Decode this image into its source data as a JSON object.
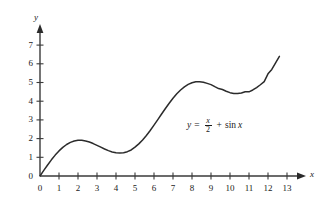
{
  "chart_data": {
    "type": "line",
    "title": "",
    "subtitle": "",
    "xlabel": "x",
    "ylabel": "y",
    "xlim": [
      0,
      13.6
    ],
    "ylim": [
      0,
      7.6
    ],
    "grid": false,
    "legend": null,
    "x_ticks": [
      0,
      1,
      2,
      3,
      4,
      5,
      6,
      7,
      8,
      9,
      10,
      11,
      12,
      13
    ],
    "x_tick_labels": [
      "0",
      "1",
      "2",
      "3",
      "4",
      "5",
      "6",
      "7",
      "8",
      "9",
      "10",
      "11",
      "12",
      "13"
    ],
    "y_ticks": [
      0,
      1,
      2,
      3,
      4,
      5,
      6,
      7
    ],
    "y_tick_labels": [
      "0",
      "1",
      "2",
      "3",
      "4",
      "5",
      "6",
      "7"
    ],
    "curve_color": "#2b2b2b",
    "axis_color": "#3a3a3a",
    "series": [
      {
        "name": "y = x/2 + sin x",
        "x_start": 0,
        "x_end": 12.6,
        "points": [
          [
            0.0,
            0.0
          ],
          [
            0.2,
            0.2987
          ],
          [
            0.4,
            0.5894
          ],
          [
            0.6,
            0.8646
          ],
          [
            0.8,
            1.1174
          ],
          [
            1.0,
            1.3415
          ],
          [
            1.2,
            1.532
          ],
          [
            1.4,
            1.6854
          ],
          [
            1.6,
            1.7996
          ],
          [
            1.8,
            1.8738
          ],
          [
            2.0,
            1.9093
          ],
          [
            2.2,
            1.9085
          ],
          [
            2.4,
            1.8755
          ],
          [
            2.6,
            1.8157
          ],
          [
            2.8,
            1.735
          ],
          [
            3.0,
            1.6411
          ],
          [
            3.2,
            1.5416
          ],
          [
            3.4,
            1.4443
          ],
          [
            3.6,
            1.3572
          ],
          [
            3.8,
            1.2876
          ],
          [
            4.0,
            1.2432
          ],
          [
            4.2,
            1.2286
          ],
          [
            4.4,
            1.2472
          ],
          [
            4.6,
            1.3016
          ],
          [
            4.8,
            1.3924
          ],
          [
            5.0,
            1.5411
          ],
          [
            5.2,
            1.7169
          ],
          [
            5.4,
            1.9274
          ],
          [
            5.6,
            2.1686
          ],
          [
            5.8,
            2.436
          ],
          [
            6.0,
            2.7206
          ],
          [
            6.2,
            3.0172
          ],
          [
            6.4,
            3.3165
          ],
          [
            6.6,
            3.611
          ],
          [
            6.8,
            3.8925
          ],
          [
            7.0,
            4.157
          ],
          [
            7.2,
            4.3934
          ],
          [
            7.4,
            4.5987
          ],
          [
            7.6,
            4.7684
          ],
          [
            7.8,
            4.8989
          ],
          [
            8.0,
            4.9894
          ],
          [
            8.2,
            5.0381
          ],
          [
            8.4,
            5.0461
          ],
          [
            8.6,
            5.0164
          ],
          [
            8.8,
            4.9531
          ],
          [
            9.0,
            4.8879
          ],
          [
            9.2,
            4.7788
          ],
          [
            9.4,
            4.6762
          ],
          [
            9.6,
            4.6253
          ],
          [
            9.8,
            4.5342
          ],
          [
            10.0,
            4.456
          ],
          [
            10.2,
            4.4129
          ],
          [
            10.4,
            4.4066
          ],
          [
            10.6,
            4.4373
          ],
          [
            10.8,
            4.5036
          ],
          [
            11.0,
            4.5
          ],
          [
            11.2,
            4.6
          ],
          [
            11.4,
            4.73
          ],
          [
            11.6,
            4.88
          ],
          [
            11.8,
            5.05
          ],
          [
            12.0,
            5.4632
          ],
          [
            12.2,
            5.7
          ],
          [
            12.4,
            6.05
          ],
          [
            12.6,
            6.4
          ]
        ]
      }
    ],
    "annotation": {
      "y_symbol": "y",
      "equals": "=",
      "numerator": "x",
      "denominator": "2",
      "plus": "+",
      "sin_label": "sin",
      "sin_arg": "x",
      "full_text": "y = x/2 + sin x"
    }
  }
}
